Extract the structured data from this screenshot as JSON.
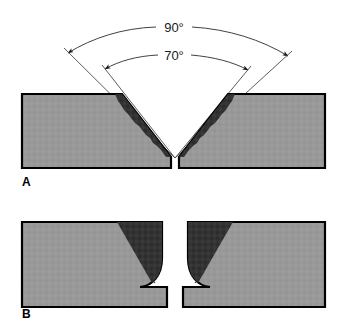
{
  "figure": {
    "background_color": "#ffffff",
    "width": 346,
    "height": 320
  },
  "colors": {
    "base_metal": "#999999",
    "bevel_face": "#333333",
    "outline": "#000000",
    "dimension_line": "#2b2b2b",
    "extension_line": "#4a4a4a",
    "text": "#000000",
    "page_background": "#ffffff"
  },
  "panels": [
    {
      "letter": "A",
      "type": "v-groove",
      "description": "Double-bevel V-groove joint with included angle dimensions",
      "dimensions": [
        {
          "id": "outer",
          "label": "90°",
          "value": 90,
          "unit": "degrees",
          "arc": "outer"
        },
        {
          "id": "inner",
          "label": "70°",
          "value": 70,
          "unit": "degrees",
          "arc": "inner"
        }
      ],
      "features": [
        {
          "name": "base-metal-plate-left",
          "fill": "#999999"
        },
        {
          "name": "base-metal-plate-right",
          "fill": "#999999"
        },
        {
          "name": "bevel-face-left",
          "fill": "#333333"
        },
        {
          "name": "bevel-face-right",
          "fill": "#333333"
        },
        {
          "name": "root-gap",
          "fill": "#ffffff"
        }
      ]
    },
    {
      "letter": "B",
      "type": "u-groove",
      "description": "U-groove joint with radiused root face and root gap",
      "dimensions": [],
      "features": [
        {
          "name": "base-metal-plate-left",
          "fill": "#999999"
        },
        {
          "name": "base-metal-plate-right",
          "fill": "#999999"
        },
        {
          "name": "bevel-face-left",
          "fill": "#333333"
        },
        {
          "name": "bevel-face-right",
          "fill": "#333333"
        },
        {
          "name": "root-radius-indicator",
          "style": "dashed"
        },
        {
          "name": "root-gap",
          "fill": "#ffffff"
        }
      ]
    }
  ]
}
